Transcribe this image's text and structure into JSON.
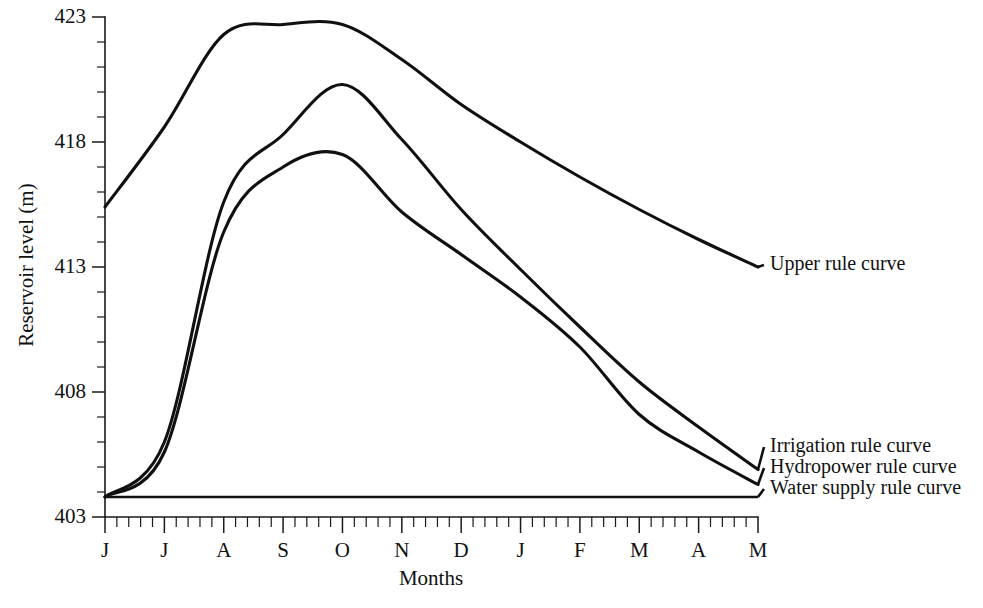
{
  "chart_data": {
    "type": "line",
    "title": "",
    "xlabel": "Months",
    "ylabel": "Reservoir level (m)",
    "xlim": [
      0,
      11
    ],
    "ylim": [
      403,
      423
    ],
    "grid": false,
    "legend_position": "right-inline-labels",
    "categories": [
      "J",
      "J",
      "A",
      "S",
      "O",
      "N",
      "D",
      "J",
      "F",
      "M",
      "A",
      "M"
    ],
    "month_names": [
      "June",
      "July",
      "August",
      "September",
      "October",
      "November",
      "December",
      "January",
      "February",
      "March",
      "April",
      "May"
    ],
    "y_ticks": [
      403,
      408,
      413,
      418,
      423
    ],
    "y_tick_labels": [
      "403",
      "408",
      "413",
      "418",
      "423"
    ],
    "minor_ticks_per_interval": 5,
    "series": [
      {
        "name": "Upper rule curve",
        "label": "Upper rule curve",
        "color": "#101010",
        "values": [
          415.4,
          418.6,
          422.3,
          422.7,
          422.7,
          421.3,
          419.5,
          418.0,
          416.6,
          415.3,
          414.1,
          413.0
        ]
      },
      {
        "name": "Irrigation rule curve",
        "label": "Irrigation rule curve",
        "color": "#101010",
        "values": [
          403.8,
          406.0,
          415.6,
          418.3,
          420.3,
          418.1,
          415.3,
          412.9,
          410.6,
          408.4,
          406.6,
          404.9
        ]
      },
      {
        "name": "Hydropower rule curve",
        "label": "Hydropower rule curve",
        "color": "#101010",
        "values": [
          403.8,
          405.6,
          414.4,
          417.0,
          417.5,
          415.2,
          413.5,
          411.8,
          409.8,
          407.1,
          405.6,
          404.3
        ]
      },
      {
        "name": "Water supply rule curve",
        "label": "Water supply rule curve",
        "color": "#101010",
        "values": [
          403.8,
          403.8,
          403.8,
          403.8,
          403.8,
          403.8,
          403.8,
          403.8,
          403.8,
          403.8,
          403.8,
          403.8
        ]
      }
    ]
  }
}
